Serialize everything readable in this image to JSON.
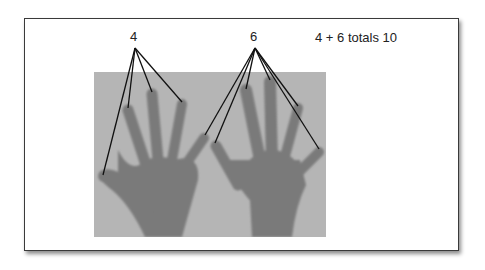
{
  "figure": {
    "left_hand_label": "4",
    "right_hand_label": "6",
    "caption": "4 + 6 totals 10",
    "colors": {
      "frame_border": "#3a3a3a",
      "photo_background": "#b5b5b5",
      "skin": "#7a7a7a",
      "pointer_lines": "#111111"
    },
    "left_hand": {
      "count": 4,
      "pointer_origin": [
        135,
        48
      ],
      "pointer_targets": [
        [
          103,
          175
        ],
        [
          128,
          108
        ],
        [
          152,
          92
        ],
        [
          182,
          102
        ]
      ]
    },
    "right_hand": {
      "count": 6,
      "pointer_origin": [
        255,
        48
      ],
      "pointer_targets": [
        [
          205,
          135
        ],
        [
          215,
          143
        ],
        [
          246,
          89
        ],
        [
          270,
          80
        ],
        [
          298,
          106
        ],
        [
          319,
          149
        ]
      ]
    }
  }
}
